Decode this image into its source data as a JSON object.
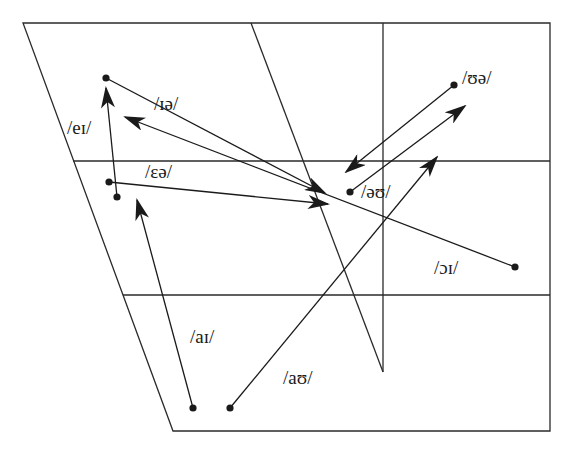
{
  "chart_data": {
    "type": "diagram",
    "title": "",
    "colors": {
      "line": "#2a2a2a",
      "background": "#ffffff"
    },
    "frame": {
      "outline": [
        [
          23,
          23
        ],
        [
          550,
          23
        ],
        [
          550,
          431
        ],
        [
          173,
          431
        ]
      ],
      "gridlines": [
        {
          "from": [
            73,
            161
          ],
          "to": [
            550,
            161
          ]
        },
        {
          "from": [
            123,
            295
          ],
          "to": [
            550,
            295
          ]
        },
        {
          "from": [
            383,
            23
          ],
          "to": [
            383,
            372
          ]
        },
        {
          "from": [
            251,
            23
          ],
          "to": [
            383,
            372
          ]
        }
      ]
    },
    "diphthongs": [
      {
        "symbol": "/ɪə/",
        "start": [
          106,
          78
        ],
        "end": [
          325,
          193
        ],
        "label_pos": [
          154,
          94
        ]
      },
      {
        "symbol": "/eɪ/",
        "start": [
          117,
          197
        ],
        "end": [
          106,
          88
        ],
        "label_pos": [
          67,
          118
        ]
      },
      {
        "symbol": "/ɛə/",
        "start": [
          109,
          182
        ],
        "end": [
          328,
          204
        ],
        "label_pos": [
          145,
          162
        ]
      },
      {
        "symbol": "/ɔɪ/",
        "start": [
          515,
          267
        ],
        "end": [
          125,
          117
        ],
        "label_pos": [
          434,
          258
        ]
      },
      {
        "symbol": "/aɪ/",
        "start": [
          193,
          408
        ],
        "end": [
          137,
          200
        ],
        "label_pos": [
          190,
          327
        ]
      },
      {
        "symbol": "/aʊ/",
        "start": [
          230,
          408
        ],
        "end": [
          437,
          157
        ],
        "label_pos": [
          283,
          368
        ]
      },
      {
        "symbol": "/ʊə/",
        "start": [
          454,
          85
        ],
        "end": [
          346,
          172
        ],
        "label_pos": [
          462,
          68
        ]
      },
      {
        "symbol": "/əʊ/",
        "start": [
          350,
          192
        ],
        "end": [
          465,
          106
        ],
        "label_pos": [
          361,
          182
        ]
      }
    ]
  },
  "labels": {
    "ia": "/ɪə/",
    "ei": "/eɪ/",
    "ea": "/ɛə/",
    "oi": "/ɔɪ/",
    "ai": "/aɪ/",
    "au": "/aʊ/",
    "ua": "/ʊə/",
    "ou": "/əʊ/"
  }
}
